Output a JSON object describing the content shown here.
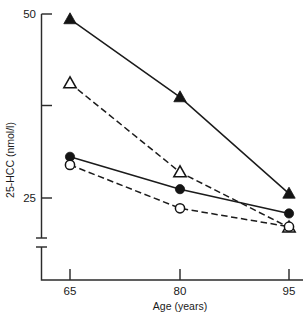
{
  "chart_data": {
    "type": "line",
    "title": "",
    "subtitle": "",
    "xlabel": "Age (years)",
    "ylabel": "25-HCC (nmol/l)",
    "x": [
      65,
      80,
      95
    ],
    "xticklabels": [
      "65",
      "80",
      "95"
    ],
    "xlim": [
      60,
      100
    ],
    "ylim": [
      18,
      50
    ],
    "yticks": [
      25,
      37.5,
      50
    ],
    "yticklabels": [
      "25",
      "",
      "50"
    ],
    "y_axis_break": true,
    "grid": false,
    "legend": "none",
    "series": [
      {
        "name": "filled-triangle",
        "marker": "triangle-filled",
        "linestyle": "solid",
        "color": "#141414",
        "values": [
          49.3,
          38.7,
          25.6
        ]
      },
      {
        "name": "open-triangle",
        "marker": "triangle-open",
        "linestyle": "dashed",
        "color": "#141414",
        "values": [
          40.6,
          28.5,
          21.0
        ]
      },
      {
        "name": "filled-circle",
        "marker": "circle-filled",
        "linestyle": "solid",
        "color": "#141414",
        "values": [
          30.6,
          26.2,
          22.9
        ]
      },
      {
        "name": "open-circle",
        "marker": "circle-open",
        "linestyle": "dashed",
        "color": "#141414",
        "values": [
          29.5,
          23.6,
          21.1
        ]
      }
    ]
  },
  "axes": {
    "y_top_label": "50",
    "y_bottom_label": "25",
    "y_title": "25-HCC (nmol/l)",
    "x_title": "Age (years)",
    "x_tick_1": "65",
    "x_tick_2": "80",
    "x_tick_3": "95"
  },
  "colors": {
    "ink": "#141414",
    "background": "#ffffff"
  }
}
